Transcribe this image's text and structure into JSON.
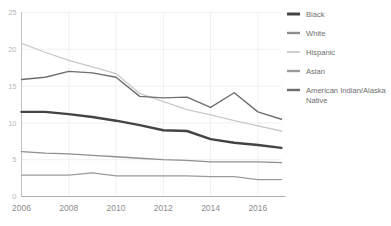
{
  "chart_data": {
    "type": "line",
    "title": "",
    "xlabel": "",
    "ylabel": "",
    "x": [
      2006,
      2007,
      2008,
      2009,
      2010,
      2011,
      2012,
      2013,
      2014,
      2015,
      2016,
      2017
    ],
    "xlim": [
      2006,
      2017
    ],
    "ylim": [
      0,
      25
    ],
    "yticks": [
      0,
      5,
      10,
      15,
      20,
      25
    ],
    "ytick_labels": [
      "0",
      "5",
      "10",
      "15",
      "20",
      "25"
    ],
    "xticks": [
      2006,
      2008,
      2010,
      2012,
      2014,
      2016
    ],
    "xtick_labels": [
      "2006",
      "2008",
      "2010",
      "2012",
      "2014",
      "2016"
    ],
    "grid": true,
    "grid_axis": "both",
    "legend_position": "right",
    "series": [
      {
        "name": "Black",
        "color": "#444444",
        "width": 2.4,
        "values": [
          11.5,
          11.5,
          11.2,
          10.8,
          10.3,
          9.7,
          9.0,
          8.9,
          7.8,
          7.3,
          7.0,
          6.6
        ]
      },
      {
        "name": "White",
        "color": "#8f8f8f",
        "width": 1.3,
        "values": [
          6.1,
          5.9,
          5.8,
          5.6,
          5.4,
          5.2,
          5.0,
          4.9,
          4.7,
          4.7,
          4.7,
          4.6
        ]
      },
      {
        "name": "Hispanic",
        "color": "#c9c9c9",
        "width": 1.3,
        "values": [
          20.8,
          19.6,
          18.5,
          17.6,
          16.7,
          14.0,
          12.9,
          11.8,
          11.1,
          10.3,
          9.6,
          8.9
        ]
      },
      {
        "name": "Asian",
        "color": "#9a9a9a",
        "width": 1.2,
        "values": [
          2.9,
          2.9,
          2.9,
          3.2,
          2.8,
          2.8,
          2.8,
          2.8,
          2.7,
          2.7,
          2.3,
          2.3
        ]
      },
      {
        "name": "American Indian/Alaska Native",
        "color": "#6e6e6e",
        "width": 1.4,
        "values": [
          15.9,
          16.2,
          17.0,
          16.8,
          16.2,
          13.6,
          13.4,
          13.5,
          12.1,
          14.1,
          11.5,
          10.5
        ]
      }
    ]
  },
  "legend": {
    "items": [
      {
        "label": "Black"
      },
      {
        "label": "White"
      },
      {
        "label": "Hispanic"
      },
      {
        "label": "Asian"
      },
      {
        "label": "American Indian/Alaska"
      },
      {
        "label": "Native"
      }
    ]
  }
}
